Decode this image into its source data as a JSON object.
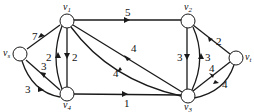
{
  "diagram": {
    "type": "directed flow network",
    "nodes": [
      {
        "id": "vs",
        "label": "v",
        "sub": "s",
        "x": 20,
        "y": 54
      },
      {
        "id": "v1",
        "label": "v",
        "sub": "1",
        "x": 67,
        "y": 21
      },
      {
        "id": "v2",
        "label": "v",
        "sub": "2",
        "x": 188,
        "y": 21
      },
      {
        "id": "v3",
        "label": "v",
        "sub": "3",
        "x": 188,
        "y": 96
      },
      {
        "id": "v4",
        "label": "v",
        "sub": "4",
        "x": 67,
        "y": 94
      },
      {
        "id": "vt",
        "label": "v",
        "sub": "t",
        "x": 236,
        "y": 58
      }
    ],
    "edges": [
      {
        "from": "vs",
        "to": "v1",
        "weight": "7"
      },
      {
        "from": "v4",
        "to": "vs",
        "weight": "3"
      },
      {
        "from": "vs",
        "to": "v4",
        "weight": "3"
      },
      {
        "from": "v4",
        "to": "v1",
        "weight": "2"
      },
      {
        "from": "v1",
        "to": "v4",
        "weight": "2"
      },
      {
        "from": "v1",
        "to": "v2",
        "weight": "5"
      },
      {
        "from": "v1",
        "to": "v3",
        "weight": "4"
      },
      {
        "from": "v3",
        "to": "v1",
        "weight": "4"
      },
      {
        "from": "v4",
        "to": "v3",
        "weight": "1"
      },
      {
        "from": "v2",
        "to": "v3",
        "weight": "3"
      },
      {
        "from": "v3",
        "to": "v2",
        "weight": "3"
      },
      {
        "from": "v2",
        "to": "vt",
        "weight": "2"
      },
      {
        "from": "v3",
        "to": "vt",
        "weight": "4"
      },
      {
        "from": "vt",
        "to": "v3",
        "weight": "4"
      }
    ]
  },
  "labels": {
    "vs": "v",
    "vs_sub": "s",
    "v1": "v",
    "v1_sub": "1",
    "v2": "v",
    "v2_sub": "2",
    "v3": "v",
    "v3_sub": "3",
    "v4": "v",
    "v4_sub": "4",
    "vt": "v",
    "vt_sub": "t",
    "w_vs_v1": "7",
    "w_v4_vs": "3",
    "w_vs_v4": "3",
    "w_v4_v1": "2",
    "w_v1_v4": "2",
    "w_v1_v2": "5",
    "w_v1_v3": "4",
    "w_v3_v1": "4",
    "w_v4_v3": "1",
    "w_v2_v3": "3",
    "w_v3_v2": "3",
    "w_v2_vt": "2",
    "w_v3_vt": "4",
    "w_vt_v3": "4"
  }
}
